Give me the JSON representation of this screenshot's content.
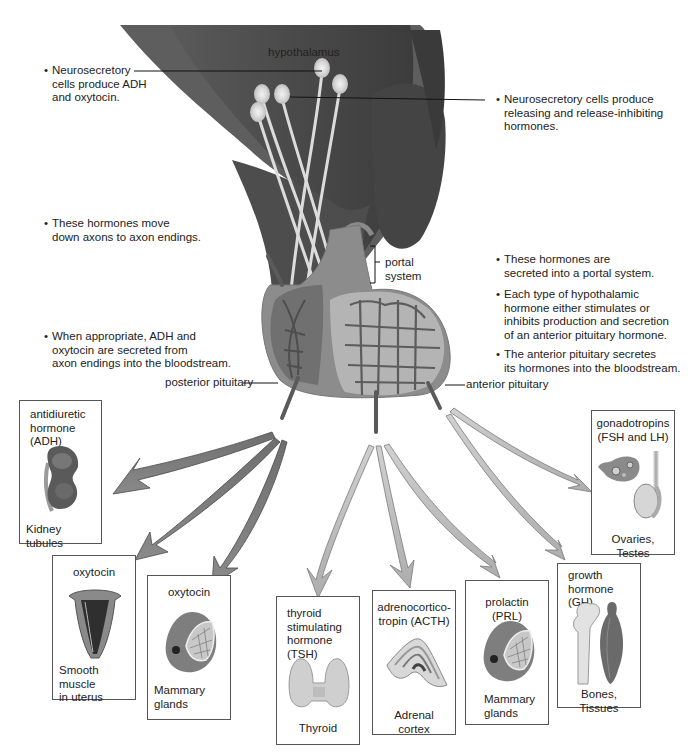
{
  "diagram": {
    "title_label": "hypothalamus",
    "structure_labels": {
      "portal_system": [
        "portal",
        "system"
      ],
      "posterior_pituitary": "posterior pituitary",
      "anterior_pituitary": "anterior pituitary"
    },
    "left_notes": [
      {
        "lines": [
          "Neurosecretory",
          "cells produce ADH",
          "and oxytocin."
        ]
      },
      {
        "lines": [
          "These hormones move",
          "down axons to axon endings."
        ]
      },
      {
        "lines": [
          "When appropriate, ADH and",
          "oxytocin are secreted from",
          "axon endings into the bloodstream."
        ]
      }
    ],
    "right_notes": [
      {
        "lines": [
          "Neurosecretory cells produce",
          "releasing and release-inhibiting",
          "hormones."
        ]
      },
      {
        "lines": [
          "These hormones are",
          "secreted into a portal system."
        ]
      },
      {
        "lines": [
          "Each type of hypothalamic",
          "hormone either stimulates or",
          "inhibits production and secretion",
          "of an anterior pituitary hormone."
        ]
      },
      {
        "lines": [
          "The anterior pituitary secretes",
          "its hormones into the bloodstream."
        ]
      }
    ],
    "bullet": "•",
    "target_boxes": [
      {
        "id": "adh",
        "hormone": [
          "antidiuretic",
          "hormone (ADH)"
        ],
        "target": [
          "Kidney tubules"
        ],
        "icon": "kidney-icon",
        "source": "posterior pituitary"
      },
      {
        "id": "oxytocin-uterus",
        "hormone": [
          "oxytocin"
        ],
        "target": [
          "Smooth muscle",
          "in uterus"
        ],
        "icon": "uterus-icon",
        "source": "posterior pituitary"
      },
      {
        "id": "oxytocin-mammary",
        "hormone": [
          "oxytocin"
        ],
        "target": [
          "Mammary",
          "glands"
        ],
        "icon": "mammary-gland-icon",
        "source": "posterior pituitary"
      },
      {
        "id": "tsh",
        "hormone": [
          "thyroid",
          "stimulating",
          "hormone (TSH)"
        ],
        "target": [
          "Thyroid"
        ],
        "icon": "thyroid-icon",
        "source": "anterior pituitary"
      },
      {
        "id": "acth",
        "hormone": [
          "adrenocortico-",
          "tropin (ACTH)"
        ],
        "target": [
          "Adrenal cortex"
        ],
        "icon": "adrenal-gland-icon",
        "source": "anterior pituitary"
      },
      {
        "id": "prl",
        "hormone": [
          "prolactin (PRL)"
        ],
        "target": [
          "Mammary",
          "glands"
        ],
        "icon": "mammary-gland-icon",
        "source": "anterior pituitary"
      },
      {
        "id": "gh",
        "hormone": [
          "growth",
          "hormone (GH)"
        ],
        "target": [
          "Bones, Tissues"
        ],
        "icon": "bone-muscle-icon",
        "source": "anterior pituitary"
      },
      {
        "id": "gonadotropins",
        "hormone": [
          "gonadotropins",
          "(FSH and LH)"
        ],
        "target": [
          "Ovaries, Testes"
        ],
        "icon": "ovary-testis-icon",
        "source": "anterior pituitary"
      }
    ],
    "colors": {
      "hypothalamus_dark": "#4a4a4a",
      "hypothalamus_mid": "#6a6a6a",
      "posterior_arrow": "#7d7d7d",
      "anterior_arrow": "#b8b8b8",
      "box_border": "#555555",
      "text": "#222222"
    }
  }
}
